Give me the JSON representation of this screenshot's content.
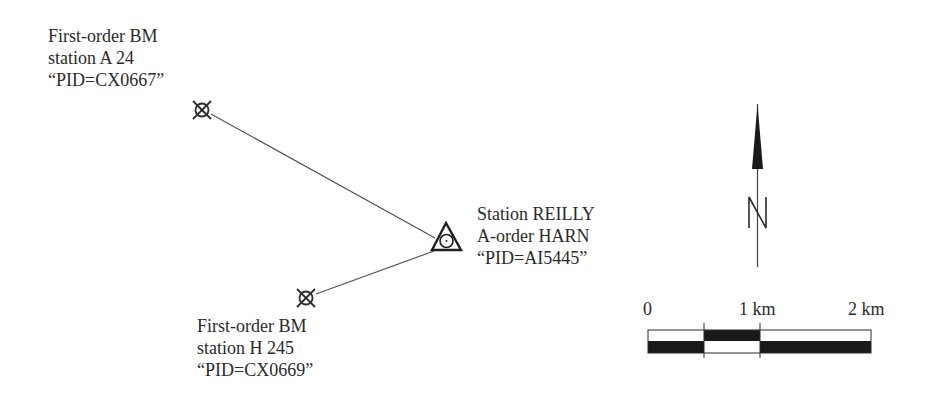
{
  "diagram": {
    "stations": [
      {
        "id": "bm-a24",
        "type": "first-order-benchmark",
        "symbol": "circle-x-benchmark-icon",
        "label_lines": [
          "First-order BM",
          "station A 24",
          "“PID=CX0667”"
        ]
      },
      {
        "id": "reilly",
        "type": "harn-station",
        "symbol": "triangle-circle-harn-icon",
        "label_lines": [
          "Station REILLY",
          "A-order HARN",
          "“PID=AI5445”"
        ]
      },
      {
        "id": "bm-h245",
        "type": "first-order-benchmark",
        "symbol": "circle-x-benchmark-icon",
        "label_lines": [
          "First-order BM",
          "station H 245",
          "“PID=CX0669”"
        ]
      }
    ],
    "connections": [
      {
        "from": "bm-a24",
        "to": "reilly"
      },
      {
        "from": "bm-h245",
        "to": "reilly"
      }
    ],
    "north_arrow": {
      "letter": "N",
      "icon": "north-arrow-icon"
    },
    "scale_bar": {
      "labels": [
        "0",
        "1 km",
        "2 km"
      ],
      "segments_top": [
        "white",
        "black",
        "white"
      ],
      "segments_bottom": [
        "black",
        "white",
        "black"
      ]
    },
    "colors": {
      "ink": "#2b2b2b",
      "background": "#ffffff",
      "fill": "#1a1a1a"
    }
  }
}
